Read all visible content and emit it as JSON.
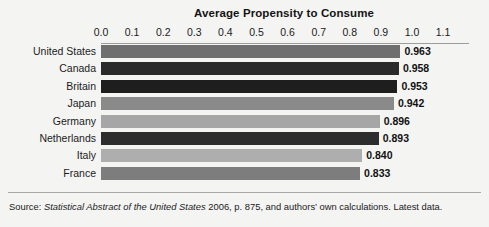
{
  "chart_data": {
    "type": "bar",
    "orientation": "horizontal",
    "title": "Average Propensity to Consume",
    "xlabel": "",
    "ylabel": "",
    "xlim": [
      0.0,
      1.1
    ],
    "grid": false,
    "categories": [
      "United States",
      "Canada",
      "Britain",
      "Japan",
      "Germany",
      "Netherlands",
      "Italy",
      "France"
    ],
    "values": [
      0.963,
      0.958,
      0.953,
      0.942,
      0.896,
      0.893,
      0.84,
      0.833
    ],
    "value_labels": [
      "0.963",
      "0.958",
      "0.953",
      "0.942",
      "0.896",
      "0.893",
      "0.840",
      "0.833"
    ],
    "bar_colors": [
      "#6f6f6f",
      "#2a2a2a",
      "#1e1e1e",
      "#8a8a8a",
      "#a6a6a6",
      "#2d2d2d",
      "#aeaeae",
      "#7d7d7d"
    ],
    "tick_labels": [
      "0.0",
      "0.1",
      "0.2",
      "0.3",
      "0.4",
      "0.5",
      "0.6",
      "0.7",
      "0.8",
      "0.9",
      "1.0",
      "1.1"
    ],
    "tick_values": [
      0.0,
      0.1,
      0.2,
      0.3,
      0.4,
      0.5,
      0.6,
      0.7,
      0.8,
      0.9,
      1.0,
      1.1
    ],
    "axis_position": "top"
  },
  "footer": {
    "source_prefix": "Source: ",
    "source_italic": "Statistical Abstract of the United States",
    "source_suffix": " 2006, p. 875, and authors’ own calculations. Latest data."
  }
}
